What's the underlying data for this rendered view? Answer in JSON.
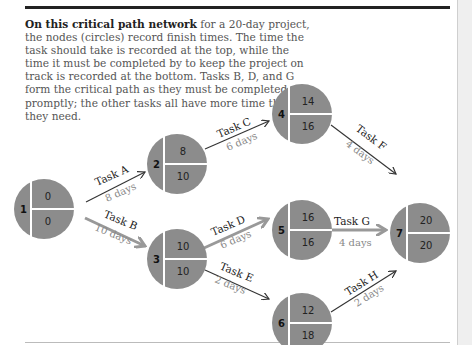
{
  "intro": {
    "bold": "On this critical path network",
    "rest": " for a 20-day project, the nodes (circles) record finish times. The time the task should take is recorded at the top, while the time it must be completed by to keep the project on track is recorded at the bottom. Tasks B, D, and G form the critical path as they must be completed promptly; the other tasks all have more time than they need."
  },
  "colors": {
    "node": "#8c8c8c",
    "critical_arrow": "#999999",
    "arrow": "#333333"
  },
  "nodes": [
    {
      "id": "1",
      "top": "0",
      "bottom": "0"
    },
    {
      "id": "2",
      "top": "8",
      "bottom": "10"
    },
    {
      "id": "3",
      "top": "10",
      "bottom": "10"
    },
    {
      "id": "4",
      "top": "14",
      "bottom": "16"
    },
    {
      "id": "5",
      "top": "16",
      "bottom": "16"
    },
    {
      "id": "6",
      "top": "12",
      "bottom": "18"
    },
    {
      "id": "7",
      "top": "20",
      "bottom": "20"
    }
  ],
  "tasks": [
    {
      "name": "Task A",
      "duration": "8 days",
      "from": "1",
      "to": "2",
      "critical": false
    },
    {
      "name": "Task B",
      "duration": "10 days",
      "from": "1",
      "to": "3",
      "critical": true
    },
    {
      "name": "Task C",
      "duration": "6 days",
      "from": "2",
      "to": "4",
      "critical": false
    },
    {
      "name": "Task D",
      "duration": "6 days",
      "from": "3",
      "to": "5",
      "critical": true
    },
    {
      "name": "Task E",
      "duration": "2 days",
      "from": "3",
      "to": "6",
      "critical": false
    },
    {
      "name": "Task F",
      "duration": "4 days",
      "from": "4",
      "to": "7",
      "critical": false
    },
    {
      "name": "Task G",
      "duration": "4 days",
      "from": "5",
      "to": "7",
      "critical": true
    },
    {
      "name": "Task H",
      "duration": "2 days",
      "from": "6",
      "to": "7",
      "critical": false
    }
  ]
}
